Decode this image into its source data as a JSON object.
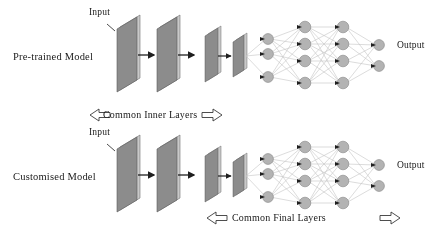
{
  "figure": {
    "type": "neural-network-transfer-learning-diagram",
    "background_color": "#ffffff",
    "text_color": "#1a1a1a",
    "slab_face_color": "#8c8c8c",
    "slab_top_color": "#c9c9c9",
    "slab_edge_color": "#5a5a5a",
    "node_color": "#b3b3b3",
    "node_edge_color": "#8f8f8f",
    "edge_color": "#bdbdbd",
    "arrow_color": "#1f1f1f",
    "band_arrow_fill": "#ffffff",
    "band_arrow_stroke": "#3a3a3a"
  },
  "rows": [
    {
      "id": "pretrained",
      "model_label": "Pre-trained Model",
      "input_label": "Input",
      "output_label": "Output"
    },
    {
      "id": "customised",
      "model_label": "Customised Model",
      "input_label": "Input",
      "output_label": "Output"
    }
  ],
  "bands": [
    {
      "id": "common-inner-layers",
      "label": "Common Inner Layers",
      "left_arrow": "left-block-arrow",
      "right_arrow": "right-block-arrow"
    },
    {
      "id": "common-final-layers",
      "label": "Common Final Layers",
      "left_arrow": "left-block-arrow",
      "right_arrow": "right-block-arrow"
    }
  ],
  "network": {
    "layer_node_counts": [
      3,
      4,
      4,
      2
    ],
    "conv_slabs_large": 2,
    "conv_slabs_small": 2
  }
}
